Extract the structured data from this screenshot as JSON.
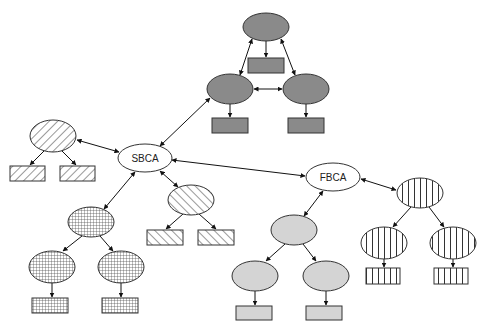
{
  "diagram": {
    "colors": {
      "dark": "#8a8a8a",
      "light": "#d4d4d4",
      "stroke": "#333333",
      "white": "#ffffff"
    },
    "hubs": [
      {
        "id": "sbca",
        "label": "SBCA",
        "cx": 145,
        "cy": 158,
        "rx": 27,
        "ry": 14
      },
      {
        "id": "fbca",
        "label": "FBCA",
        "cx": 333,
        "cy": 177,
        "rx": 27,
        "ry": 14
      }
    ],
    "clusters": [
      {
        "id": "top-mesh",
        "fill": "dark",
        "ellipses": [
          {
            "cx": 266,
            "cy": 27,
            "rx": 23,
            "ry": 14
          },
          {
            "cx": 230,
            "cy": 89,
            "rx": 23,
            "ry": 15
          },
          {
            "cx": 306,
            "cy": 89,
            "rx": 23,
            "ry": 15
          }
        ],
        "rects": [
          {
            "x": 248,
            "y": 58,
            "w": 36,
            "h": 15
          },
          {
            "x": 212,
            "y": 118,
            "w": 36,
            "h": 15
          },
          {
            "x": 288,
            "y": 118,
            "w": 36,
            "h": 15
          }
        ]
      },
      {
        "id": "left-hatch",
        "fill": "hatch-fwd",
        "ellipses": [
          {
            "cx": 53,
            "cy": 136,
            "rx": 23,
            "ry": 16
          }
        ],
        "rects": [
          {
            "x": 10,
            "y": 166,
            "w": 35,
            "h": 15
          },
          {
            "x": 60,
            "y": 166,
            "w": 35,
            "h": 15
          }
        ]
      },
      {
        "id": "sbca-child-hatch",
        "fill": "hatch-back",
        "ellipses": [
          {
            "cx": 191,
            "cy": 200,
            "rx": 23,
            "ry": 15
          }
        ],
        "rects": [
          {
            "x": 147,
            "y": 230,
            "w": 36,
            "h": 15
          },
          {
            "x": 198,
            "y": 230,
            "w": 36,
            "h": 15
          }
        ]
      },
      {
        "id": "crosshatch-tree",
        "fill": "grid",
        "ellipses": [
          {
            "cx": 91,
            "cy": 222,
            "rx": 23,
            "ry": 15
          },
          {
            "cx": 52,
            "cy": 267,
            "rx": 23,
            "ry": 16
          },
          {
            "cx": 121,
            "cy": 267,
            "rx": 23,
            "ry": 16
          }
        ],
        "rects": [
          {
            "x": 32,
            "y": 298,
            "w": 36,
            "h": 15
          },
          {
            "x": 102,
            "y": 298,
            "w": 36,
            "h": 15
          }
        ]
      },
      {
        "id": "light-tree",
        "fill": "light",
        "ellipses": [
          {
            "cx": 294,
            "cy": 230,
            "rx": 23,
            "ry": 15
          },
          {
            "cx": 255,
            "cy": 276,
            "rx": 23,
            "ry": 15
          },
          {
            "cx": 326,
            "cy": 276,
            "rx": 23,
            "ry": 15
          }
        ],
        "rects": [
          {
            "x": 236,
            "y": 306,
            "w": 36,
            "h": 14
          },
          {
            "x": 306,
            "y": 306,
            "w": 36,
            "h": 14
          }
        ]
      },
      {
        "id": "stripe-tree",
        "fill": "vstripe",
        "ellipses": [
          {
            "cx": 420,
            "cy": 193,
            "rx": 23,
            "ry": 15
          },
          {
            "cx": 384,
            "cy": 243,
            "rx": 23,
            "ry": 16
          },
          {
            "cx": 453,
            "cy": 243,
            "rx": 23,
            "ry": 16
          }
        ],
        "rects": [
          {
            "x": 366,
            "y": 268,
            "w": 34,
            "h": 16
          },
          {
            "x": 434,
            "y": 268,
            "w": 34,
            "h": 16
          }
        ]
      }
    ],
    "edges": [
      {
        "x1": 252,
        "y1": 39,
        "x2": 240,
        "y2": 75,
        "type": "both"
      },
      {
        "x1": 281,
        "y1": 39,
        "x2": 295,
        "y2": 75,
        "type": "both"
      },
      {
        "x1": 254,
        "y1": 89,
        "x2": 282,
        "y2": 89,
        "type": "both"
      },
      {
        "x1": 266,
        "y1": 41,
        "x2": 266,
        "y2": 57,
        "type": "one"
      },
      {
        "x1": 230,
        "y1": 104,
        "x2": 230,
        "y2": 117,
        "type": "one"
      },
      {
        "x1": 306,
        "y1": 104,
        "x2": 306,
        "y2": 117,
        "type": "one"
      },
      {
        "x1": 160,
        "y1": 146,
        "x2": 210,
        "y2": 98,
        "type": "both"
      },
      {
        "x1": 119,
        "y1": 152,
        "x2": 77,
        "y2": 140,
        "type": "both"
      },
      {
        "x1": 45,
        "y1": 150,
        "x2": 30,
        "y2": 165,
        "type": "one"
      },
      {
        "x1": 61,
        "y1": 150,
        "x2": 76,
        "y2": 165,
        "type": "one"
      },
      {
        "x1": 172,
        "y1": 160,
        "x2": 305,
        "y2": 176,
        "type": "both"
      },
      {
        "x1": 160,
        "y1": 171,
        "x2": 178,
        "y2": 187,
        "type": "both"
      },
      {
        "x1": 183,
        "y1": 214,
        "x2": 166,
        "y2": 229,
        "type": "one"
      },
      {
        "x1": 199,
        "y1": 214,
        "x2": 216,
        "y2": 229,
        "type": "one"
      },
      {
        "x1": 135,
        "y1": 172,
        "x2": 104,
        "y2": 209,
        "type": "both"
      },
      {
        "x1": 82,
        "y1": 236,
        "x2": 63,
        "y2": 251,
        "type": "one"
      },
      {
        "x1": 100,
        "y1": 236,
        "x2": 113,
        "y2": 251,
        "type": "one"
      },
      {
        "x1": 52,
        "y1": 283,
        "x2": 52,
        "y2": 297,
        "type": "one"
      },
      {
        "x1": 121,
        "y1": 283,
        "x2": 121,
        "y2": 297,
        "type": "one"
      },
      {
        "x1": 323,
        "y1": 191,
        "x2": 304,
        "y2": 216,
        "type": "both"
      },
      {
        "x1": 285,
        "y1": 244,
        "x2": 266,
        "y2": 261,
        "type": "one"
      },
      {
        "x1": 303,
        "y1": 244,
        "x2": 316,
        "y2": 261,
        "type": "one"
      },
      {
        "x1": 255,
        "y1": 291,
        "x2": 255,
        "y2": 305,
        "type": "one"
      },
      {
        "x1": 326,
        "y1": 291,
        "x2": 326,
        "y2": 305,
        "type": "one"
      },
      {
        "x1": 361,
        "y1": 179,
        "x2": 396,
        "y2": 190,
        "type": "both"
      },
      {
        "x1": 411,
        "y1": 207,
        "x2": 393,
        "y2": 227,
        "type": "one"
      },
      {
        "x1": 429,
        "y1": 207,
        "x2": 444,
        "y2": 227,
        "type": "one"
      },
      {
        "x1": 384,
        "y1": 259,
        "x2": 384,
        "y2": 267,
        "type": "one"
      },
      {
        "x1": 453,
        "y1": 259,
        "x2": 453,
        "y2": 267,
        "type": "one"
      }
    ]
  }
}
